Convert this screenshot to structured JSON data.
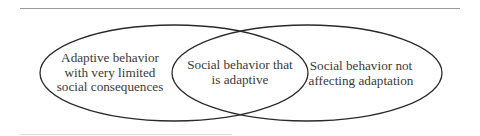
{
  "diagram": {
    "type": "venn",
    "sets": [
      {
        "id": "adaptive-behavior",
        "description": "Adaptive behavior"
      },
      {
        "id": "social-behavior",
        "description": "Social behavior"
      }
    ],
    "regions": {
      "left": {
        "lines": [
          "Adaptive behavior",
          "with very limited",
          "social consequences"
        ]
      },
      "middle": {
        "lines": [
          "Social behavior that",
          "is adaptive"
        ]
      },
      "right": {
        "lines": [
          "Social behavior not",
          "affecting adaptation"
        ]
      }
    },
    "colors": {
      "stroke": "#2a2a2a",
      "text": "#3a3a3a",
      "rule": "#9a9a9a",
      "background": "#ffffff"
    }
  }
}
